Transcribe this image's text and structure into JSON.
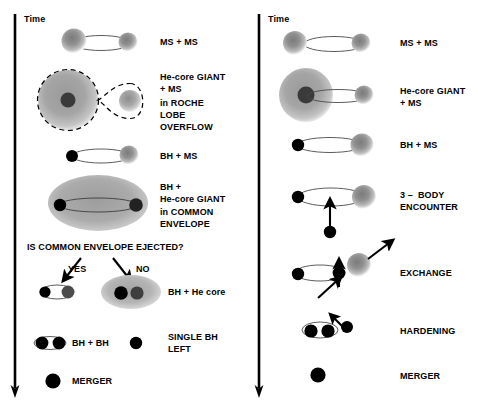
{
  "figure": {
    "panels": [
      {
        "id": "isolated-binary-evolution",
        "time_axis_label": "Time",
        "stages": [
          {
            "id": "ms-ms",
            "label": "MS + MS",
            "label_lines": [
              "MS + MS"
            ]
          },
          {
            "id": "he-core-giant-roche-lobe-overflow",
            "label": "He-core GIANT + MS in ROCHE LOBE OVERFLOW",
            "label_lines": [
              "He-core GIANT",
              "+ MS",
              "in ROCHE",
              "LOBE",
              "OVERFLOW"
            ]
          },
          {
            "id": "bh-ms",
            "label": "BH + MS",
            "label_lines": [
              "BH + MS"
            ]
          },
          {
            "id": "bh-he-core-giant-common-envelope",
            "label": "BH + He-core GIANT in COMMON ENVELOPE",
            "label_lines": [
              "BH +",
              "He-core GIANT",
              "in COMMON",
              "ENVELOPE"
            ]
          },
          {
            "id": "common-envelope-question",
            "label": "IS COMMON ENVELOPE EJECTED?",
            "label_lines": [
              "IS COMMON ENVELOPE EJECTED?"
            ]
          },
          {
            "id": "branch-yes",
            "label": "YES",
            "label_lines": [
              "YES"
            ]
          },
          {
            "id": "branch-no",
            "label": "NO",
            "label_lines": [
              "NO"
            ]
          },
          {
            "id": "bh-he-core",
            "label": "BH + He core",
            "label_lines": [
              "BH + He core"
            ]
          },
          {
            "id": "bh-bh",
            "label": "BH + BH",
            "label_lines": [
              "BH + BH"
            ]
          },
          {
            "id": "single-bh-left",
            "label": "SINGLE BH LEFT",
            "label_lines": [
              "SINGLE BH",
              "LEFT"
            ]
          },
          {
            "id": "merger-left",
            "label": "MERGER",
            "label_lines": [
              "MERGER"
            ]
          }
        ]
      },
      {
        "id": "dynamical-cluster-formation",
        "time_axis_label": "Time",
        "stages": [
          {
            "id": "ms-ms-r",
            "label": "MS + MS",
            "label_lines": [
              "MS + MS"
            ]
          },
          {
            "id": "he-core-giant-ms-r",
            "label": "He-core GIANT + MS",
            "label_lines": [
              "He-core GIANT",
              "+ MS"
            ]
          },
          {
            "id": "bh-ms-r",
            "label": "BH + MS",
            "label_lines": [
              "BH + MS"
            ]
          },
          {
            "id": "three-body-encounter",
            "label": "3 – BODY ENCOUNTER",
            "label_lines": [
              "3 –  BODY",
              "ENCOUNTER"
            ]
          },
          {
            "id": "exchange",
            "label": "EXCHANGE",
            "label_lines": [
              "EXCHANGE"
            ]
          },
          {
            "id": "hardening",
            "label": "HARDENING",
            "label_lines": [
              "HARDENING"
            ]
          },
          {
            "id": "merger-right",
            "label": "MERGER",
            "label_lines": [
              "MERGER"
            ]
          }
        ]
      }
    ],
    "colors": {
      "background": "#ffffff",
      "stroke": "#000000",
      "black_hole": "#000000",
      "star_gray": "#8e8e8e",
      "star_gray_dark": "#6f6f6f",
      "envelope_gray": "#a8a8a8",
      "giant_core": "#3a3a3a"
    }
  }
}
